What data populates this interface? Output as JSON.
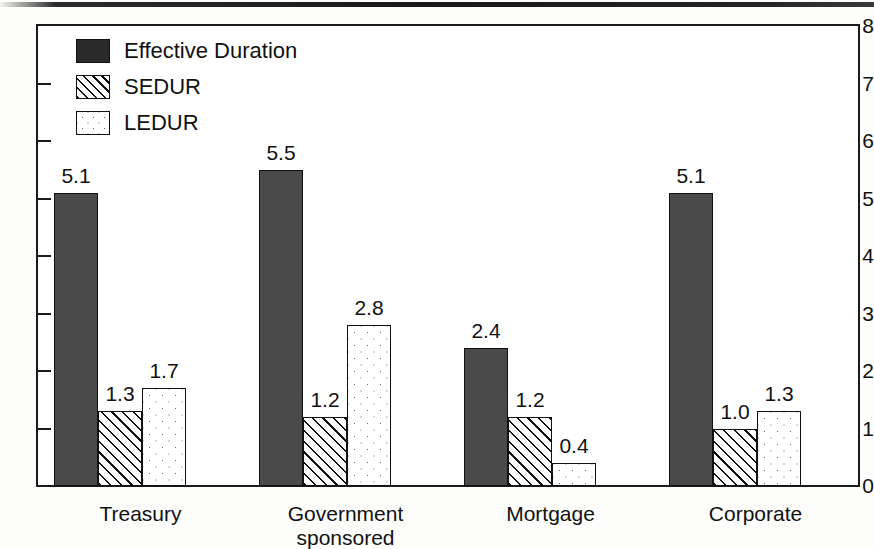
{
  "chart_data": {
    "type": "bar",
    "title": "",
    "xlabel": "",
    "ylabel": "",
    "ylim": [
      0,
      8
    ],
    "yticks": [
      "0",
      "1",
      "2",
      "3",
      "4",
      "5",
      "6",
      "7",
      "8"
    ],
    "grid": false,
    "legend_position": "top-left",
    "categories": [
      "Treasury",
      "Government\nsponsored",
      "Mortgage",
      "Corporate"
    ],
    "series": [
      {
        "name": "Effective Duration",
        "values": [
          5.1,
          5.5,
          2.4,
          5.1
        ],
        "pattern": "solid-dark",
        "color": "#4a4a4a"
      },
      {
        "name": "SEDUR",
        "values": [
          1.3,
          1.2,
          1.2,
          1.0
        ],
        "pattern": "diagonal-hatch",
        "color": "#ffffff"
      },
      {
        "name": "LEDUR",
        "values": [
          1.7,
          2.8,
          0.4,
          1.3
        ],
        "pattern": "dotted",
        "color": "#ffffff"
      }
    ],
    "data_labels": [
      [
        "5.1",
        "1.3",
        "1.7"
      ],
      [
        "5.5",
        "1.2",
        "2.8"
      ],
      [
        "2.4",
        "1.2",
        "0.4"
      ],
      [
        "5.1",
        "1.0",
        "1.3"
      ]
    ]
  }
}
